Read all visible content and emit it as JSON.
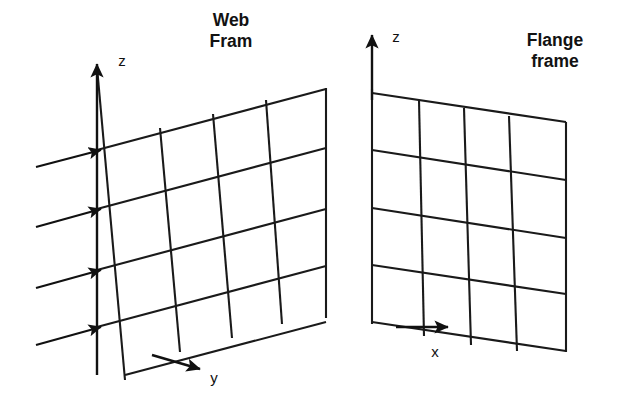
{
  "figure": {
    "kind": "engineering-diagram",
    "background_color": "#ffffff",
    "line_color": "#1a1a1a",
    "text_color": "#121212",
    "width": 629,
    "height": 409
  },
  "labels": {
    "web_frame_title_line1": "Web",
    "web_frame_title_line2": "Fram",
    "flange_frame_title_line1": "Flange",
    "flange_frame_title_line2": "frame",
    "web_z_axis": "z",
    "web_y_axis": "y",
    "flange_z_axis": "z",
    "flange_x_axis": "x"
  },
  "web_frame": {
    "name": "Web Frame",
    "grid_rows": 4,
    "grid_cols": 4,
    "horizontal_lines": 5,
    "vertical_lines": 5,
    "slope_direction": "up-right",
    "load_arrow_count": 4,
    "axes": [
      "z",
      "y"
    ],
    "origin": {
      "x": 97,
      "y": 327
    }
  },
  "flange_frame": {
    "name": "Flange frame",
    "grid_rows": 4,
    "grid_cols": 4,
    "horizontal_lines": 5,
    "vertical_lines": 5,
    "slope_direction": "down-right",
    "load_arrow_count": 0,
    "axes": [
      "z",
      "x"
    ],
    "origin": {
      "x": 372,
      "y": 322
    }
  },
  "geometry": {
    "web": {
      "h_lines": [
        {
          "x1": 97,
          "y1": 150,
          "x2": 326,
          "y2": 89
        },
        {
          "x1": 97,
          "y1": 209,
          "x2": 326,
          "y2": 148
        },
        {
          "x1": 97,
          "y1": 270,
          "x2": 326,
          "y2": 209
        },
        {
          "x1": 97,
          "y1": 327,
          "x2": 326,
          "y2": 266
        },
        {
          "x1": 125,
          "y1": 375,
          "x2": 326,
          "y2": 322
        }
      ],
      "v_lines": [
        {
          "x1": 97,
          "y1": 67,
          "x2": 125,
          "y2": 380
        },
        {
          "x1": 160,
          "y1": 128,
          "x2": 180,
          "y2": 352
        },
        {
          "x1": 213,
          "y1": 114,
          "x2": 232,
          "y2": 338
        },
        {
          "x1": 266,
          "y1": 100,
          "x2": 282,
          "y2": 324
        },
        {
          "x1": 326,
          "y1": 88,
          "x2": 326,
          "y2": 318
        }
      ],
      "load_arrows": [
        {
          "x1": 36,
          "y1": 167,
          "x2": 101,
          "y2": 150
        },
        {
          "x1": 36,
          "y1": 227,
          "x2": 101,
          "y2": 209
        },
        {
          "x1": 36,
          "y1": 288,
          "x2": 101,
          "y2": 270
        },
        {
          "x1": 36,
          "y1": 345,
          "x2": 101,
          "y2": 327
        }
      ],
      "z_axis": {
        "x1": 97,
        "y1": 375,
        "x2": 97,
        "y2": 64
      },
      "y_axis": {
        "x1": 152,
        "y1": 355,
        "x2": 200,
        "y2": 369
      }
    },
    "flange": {
      "h_lines": [
        {
          "x1": 372,
          "y1": 93,
          "x2": 566,
          "y2": 122
        },
        {
          "x1": 372,
          "y1": 150,
          "x2": 566,
          "y2": 180
        },
        {
          "x1": 372,
          "y1": 208,
          "x2": 566,
          "y2": 238
        },
        {
          "x1": 372,
          "y1": 265,
          "x2": 566,
          "y2": 294
        },
        {
          "x1": 372,
          "y1": 322,
          "x2": 566,
          "y2": 351
        }
      ],
      "v_lines": [
        {
          "x1": 372,
          "y1": 89,
          "x2": 372,
          "y2": 324
        },
        {
          "x1": 419,
          "y1": 100,
          "x2": 424,
          "y2": 336
        },
        {
          "x1": 464,
          "y1": 108,
          "x2": 471,
          "y2": 345
        },
        {
          "x1": 509,
          "y1": 116,
          "x2": 517,
          "y2": 351
        },
        {
          "x1": 566,
          "y1": 122,
          "x2": 566,
          "y2": 352
        }
      ],
      "z_axis": {
        "x1": 372,
        "y1": 100,
        "x2": 372,
        "y2": 35
      },
      "x_axis": {
        "x1": 396,
        "y1": 327,
        "x2": 448,
        "y2": 327
      }
    }
  },
  "text_positions": {
    "web_title": {
      "x": 231,
      "y": 26
    },
    "flange_title": {
      "x": 555,
      "y": 46
    },
    "web_z": {
      "x": 122,
      "y": 66
    },
    "web_y": {
      "x": 214,
      "y": 383
    },
    "flange_z": {
      "x": 396,
      "y": 42
    },
    "flange_x": {
      "x": 435,
      "y": 357
    }
  }
}
